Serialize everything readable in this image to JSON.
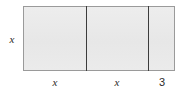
{
  "figure": {
    "type": "area-model-rectangle",
    "height_label": "x",
    "segments": [
      {
        "label": "x"
      },
      {
        "label": "x"
      },
      {
        "label": "3"
      }
    ]
  },
  "colors": {
    "fill": "#eaeaea",
    "outline": "#9a9a9a",
    "divider": "#3c3c3c",
    "text": "#2b2b2b",
    "background": "#ffffff"
  },
  "chart_data": {
    "type": "bar",
    "title": "",
    "xlabel": "",
    "ylabel": "",
    "categories": [
      "x",
      "x",
      "3"
    ],
    "values": [
      62,
      62,
      26
    ]
  }
}
